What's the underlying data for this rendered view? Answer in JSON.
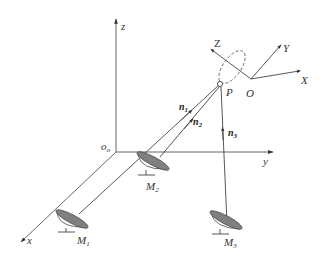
{
  "figure": {
    "type": "3d-coordinate-schematic",
    "global_frame": {
      "origin_label": "o",
      "origin_subscript": "o",
      "axes": {
        "x": "x",
        "y": "y",
        "z": "z"
      }
    },
    "local_frame": {
      "origin_label": "O",
      "axes": {
        "X": "X",
        "Y": "Y",
        "Z": "Z"
      }
    },
    "point": {
      "label": "P"
    },
    "mirrors": [
      {
        "label": "M",
        "subscript": "1"
      },
      {
        "label": "M",
        "subscript": "2"
      },
      {
        "label": "M",
        "subscript": "3"
      }
    ],
    "vectors": [
      {
        "label": "n",
        "subscript": "1"
      },
      {
        "label": "n",
        "subscript": "2"
      },
      {
        "label": "n",
        "subscript": "3"
      }
    ],
    "colors": {
      "line": "#444444",
      "dish_fill": "#808080",
      "background": "#ffffff"
    }
  }
}
